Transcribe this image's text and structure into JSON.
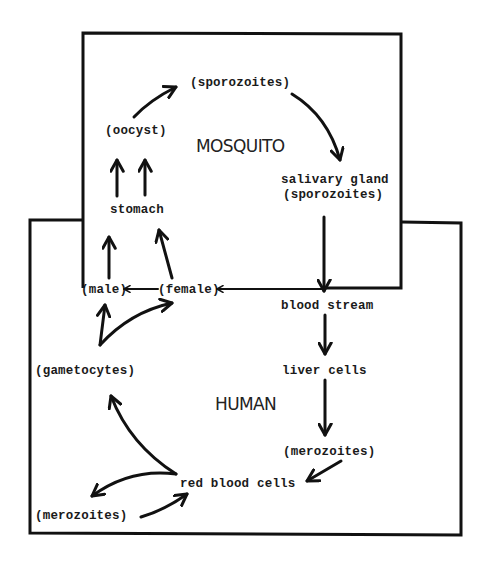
{
  "diagram": {
    "regions": {
      "mosquito": {
        "label": "MOSQUITO"
      },
      "human": {
        "label": "HUMAN"
      }
    },
    "nodes": {
      "sporozoites_top": "(sporozoites)",
      "oocyst": "(oocyst)",
      "stomach": "stomach",
      "salivary_gland": "salivary gland",
      "salivary_sporozoites": "(sporozoites)",
      "male": "(male)",
      "female": "(female)",
      "blood_stream": "blood stream",
      "liver_cells": "liver cells",
      "gametocytes": "(gametocytes)",
      "merozoites_right": "(merozoites)",
      "red_blood_cells": "red blood cells",
      "merozoites_left": "(merozoites)"
    },
    "edges": [
      {
        "from": "stomach",
        "to": "oocyst"
      },
      {
        "from": "oocyst",
        "to": "sporozoites_top"
      },
      {
        "from": "sporozoites_top",
        "to": "salivary_gland"
      },
      {
        "from": "salivary_gland",
        "to": "blood_stream"
      },
      {
        "from": "blood_stream",
        "to": "liver_cells"
      },
      {
        "from": "liver_cells",
        "to": "merozoites_right"
      },
      {
        "from": "merozoites_right",
        "to": "red_blood_cells"
      },
      {
        "from": "red_blood_cells",
        "to": "merozoites_left"
      },
      {
        "from": "merozoites_left",
        "to": "red_blood_cells"
      },
      {
        "from": "red_blood_cells",
        "to": "gametocytes"
      },
      {
        "from": "gametocytes",
        "to": "male"
      },
      {
        "from": "gametocytes",
        "to": "female"
      },
      {
        "from": "male",
        "to": "stomach"
      },
      {
        "from": "female",
        "to": "stomach"
      },
      {
        "from": "blood_stream",
        "to": "female"
      },
      {
        "from": "female",
        "to": "male"
      }
    ]
  }
}
